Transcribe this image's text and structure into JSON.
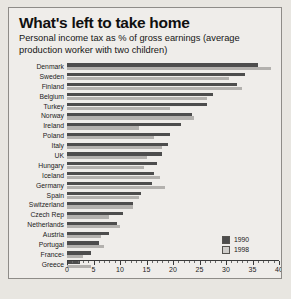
{
  "chart_data": {
    "type": "bar",
    "title": "What's left to take home",
    "subtitle": "Personal income tax as % of gross earnings (average production worker with two children)",
    "orientation": "horizontal",
    "xlabel": "",
    "ylabel": "",
    "xlim": [
      0,
      40
    ],
    "xticks": [
      0,
      5,
      10,
      15,
      20,
      25,
      30,
      35,
      40
    ],
    "tick_labels": [
      "0",
      "5",
      "10",
      "15",
      "20",
      "25",
      "30",
      "35",
      "40"
    ],
    "minor_tick_step": 1,
    "grid": false,
    "legend_position": "bottom-right",
    "categories": [
      "Denmark",
      "Sweden",
      "Finland",
      "Belgium",
      "Turkey",
      "Norway",
      "Ireland",
      "Poland",
      "Italy",
      "UK",
      "Hungary",
      "Iceland",
      "Germany",
      "Spain",
      "Switzerland",
      "Czech Rep",
      "Netherlands",
      "Austria",
      "Portugal",
      "France¹",
      "Greece"
    ],
    "series": [
      {
        "name": "1990",
        "color": "#4d4d4d",
        "values": [
          36.0,
          33.5,
          32.0,
          27.5,
          26.5,
          23.5,
          21.5,
          19.5,
          19.0,
          18.0,
          17.0,
          16.5,
          16.0,
          14.0,
          12.5,
          10.5,
          9.5,
          8.0,
          6.0,
          4.5,
          2.5
        ]
      },
      {
        "name": "1998",
        "color": "#b3b1ae",
        "values": [
          38.5,
          30.5,
          33.0,
          26.5,
          19.5,
          24.0,
          13.5,
          16.5,
          18.0,
          15.0,
          14.5,
          17.5,
          18.5,
          13.5,
          12.5,
          8.0,
          10.0,
          6.5,
          7.0,
          3.0,
          4.5
        ]
      }
    ]
  },
  "legend": {
    "items": [
      {
        "label": "1990"
      },
      {
        "label": "1998"
      }
    ]
  }
}
